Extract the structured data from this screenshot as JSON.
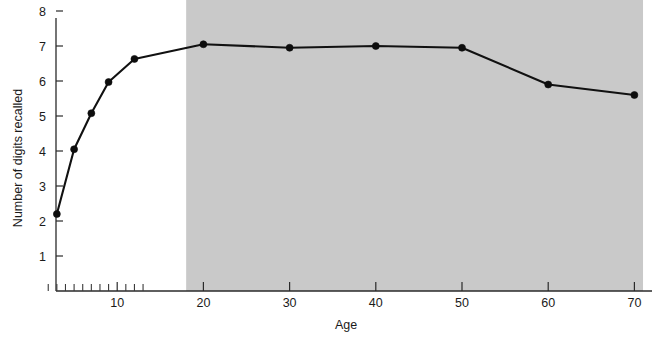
{
  "figure": {
    "background_color": "#ffffff",
    "line_color": "#111111",
    "marker_color": "#0d0d0d",
    "shade_color": "#c9c9c9",
    "axis_color": "#2a2a2a"
  },
  "chart_data": {
    "type": "line",
    "title": "",
    "xlabel": "Age",
    "ylabel": "Number of digits recalled",
    "xlim": [
      0,
      72
    ],
    "ylim": [
      0,
      8.35
    ],
    "grid": false,
    "legend": null,
    "x_ticks": [
      10,
      20,
      30,
      40,
      50,
      60,
      70
    ],
    "x_tick_labels": [
      "10",
      "20",
      "30",
      "40",
      "50",
      "60",
      "70"
    ],
    "x_minor_ticks": [
      2,
      3,
      4,
      5,
      6,
      7,
      8,
      9,
      11,
      12,
      13
    ],
    "y_ticks": [
      1,
      2,
      3,
      4,
      5,
      6,
      7,
      8
    ],
    "y_tick_labels": [
      "1",
      "2",
      "3",
      "4",
      "5",
      "6",
      "7",
      "8"
    ],
    "x": [
      3,
      5,
      7,
      9,
      12,
      20,
      30,
      40,
      50,
      60,
      70
    ],
    "values": [
      2.2,
      4.05,
      5.08,
      5.97,
      6.63,
      7.05,
      6.95,
      7.0,
      6.95,
      5.9,
      5.6
    ],
    "series": [
      {
        "name": "Number of digits recalled",
        "values": [
          2.2,
          4.05,
          5.08,
          5.97,
          6.63,
          7.05,
          6.95,
          7.0,
          6.95,
          5.9,
          5.6
        ]
      }
    ],
    "annotations": [
      {
        "type": "shaded-region",
        "label": "adulthood-shaded-band",
        "x_start": 18,
        "x_end": 71,
        "y_start": 0,
        "y_end": 8.35,
        "color": "#c9c9c9"
      }
    ]
  }
}
